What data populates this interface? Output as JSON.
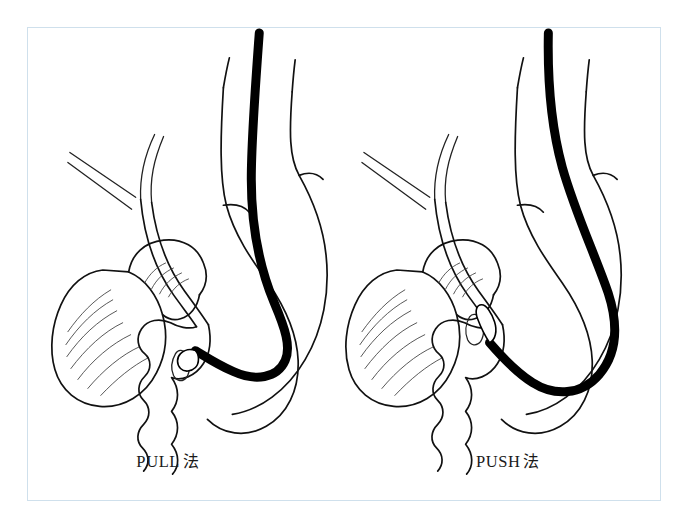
{
  "figure": {
    "frame_color": "#cfe0ec",
    "background_color": "#ffffff",
    "line_color": "#111111",
    "scope_color": "#000000"
  },
  "panels": [
    {
      "id": "pull",
      "caption_latin": "PULL",
      "caption_cjk": "法",
      "organs": [
        "esophagus",
        "stomach",
        "duodenum",
        "gallbladder",
        "pancreas",
        "common-bile-duct",
        "hepatic-ducts",
        "papilla"
      ],
      "scope_state": "shortened-straight-along-lesser-curvature"
    },
    {
      "id": "push",
      "caption_latin": "PUSH",
      "caption_cjk": "法",
      "organs": [
        "esophagus",
        "stomach",
        "duodenum",
        "gallbladder",
        "pancreas",
        "common-bile-duct",
        "hepatic-ducts",
        "papilla"
      ],
      "scope_state": "looped-greater-curvature-long-scope"
    }
  ]
}
